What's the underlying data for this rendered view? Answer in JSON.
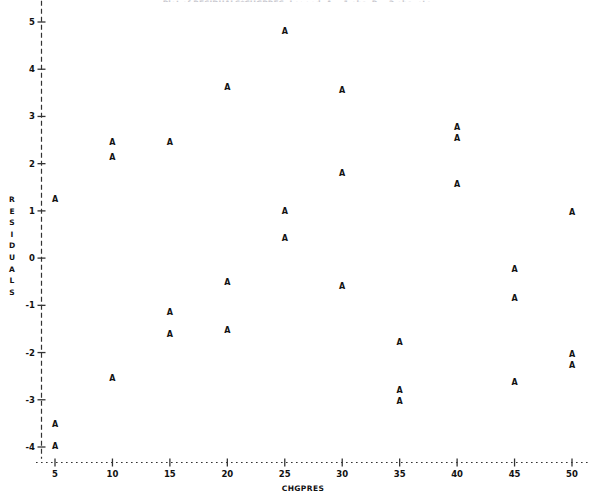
{
  "title": "Plot of RESIDUALS*CHGPRES.  Legend: A = 1 obs, B = 2 obs, etc.",
  "axes": {
    "ylabel_chars": [
      "R",
      "E",
      "S",
      "I",
      "D",
      "U",
      "A",
      "L",
      "S"
    ],
    "ylabel": "RESIDUALS",
    "xlabel": "CHGPRES",
    "y_ticks": [
      "5",
      "4",
      "3",
      "2",
      "1",
      "0",
      "-1",
      "-2",
      "-3",
      "-4"
    ],
    "x_ticks": [
      "5",
      "10",
      "15",
      "20",
      "25",
      "30",
      "35",
      "40",
      "45",
      "50"
    ]
  },
  "marker_symbol": "A",
  "colors": {
    "ink": "#111111",
    "background": "#ffffff",
    "axis": "#333333"
  },
  "chart_data": {
    "type": "scatter",
    "title": "Plot of RESIDUALS*CHGPRES.  Legend: A = 1 obs, B = 2 obs, etc.",
    "xlabel": "CHGPRES",
    "ylabel": "RESIDUALS",
    "xlim": [
      3.2,
      51.5
    ],
    "ylim": [
      -4.4,
      5.4
    ],
    "x_ticks": [
      5,
      10,
      15,
      20,
      25,
      30,
      35,
      40,
      45,
      50
    ],
    "y_ticks": [
      5,
      4,
      3,
      2,
      1,
      0,
      -1,
      -2,
      -3,
      -4
    ],
    "grid": false,
    "legend": null,
    "marker_label": "A",
    "series": [
      {
        "name": "A = 1 obs",
        "points": [
          {
            "x": 5,
            "y": 1.23
          },
          {
            "x": 5,
            "y": -3.54
          },
          {
            "x": 5,
            "y": -4.0
          },
          {
            "x": 10,
            "y": 2.44
          },
          {
            "x": 10,
            "y": 2.12
          },
          {
            "x": 10,
            "y": -2.56
          },
          {
            "x": 15,
            "y": 2.44
          },
          {
            "x": 15,
            "y": -1.17
          },
          {
            "x": 15,
            "y": -1.63
          },
          {
            "x": 20,
            "y": 3.6
          },
          {
            "x": 20,
            "y": -0.53
          },
          {
            "x": 20,
            "y": -1.55
          },
          {
            "x": 25,
            "y": 4.79
          },
          {
            "x": 25,
            "y": 0.97
          },
          {
            "x": 25,
            "y": 0.4
          },
          {
            "x": 30,
            "y": 3.54
          },
          {
            "x": 30,
            "y": 1.78
          },
          {
            "x": 30,
            "y": -0.61
          },
          {
            "x": 35,
            "y": -1.8
          },
          {
            "x": 35,
            "y": -2.82
          },
          {
            "x": 35,
            "y": -3.05
          },
          {
            "x": 40,
            "y": 2.75
          },
          {
            "x": 40,
            "y": 2.52
          },
          {
            "x": 40,
            "y": 1.55
          },
          {
            "x": 45,
            "y": -0.25
          },
          {
            "x": 45,
            "y": -0.87
          },
          {
            "x": 45,
            "y": -2.65
          },
          {
            "x": 50,
            "y": 0.95
          },
          {
            "x": 50,
            "y": -2.05
          },
          {
            "x": 50,
            "y": -2.29
          }
        ]
      }
    ]
  }
}
